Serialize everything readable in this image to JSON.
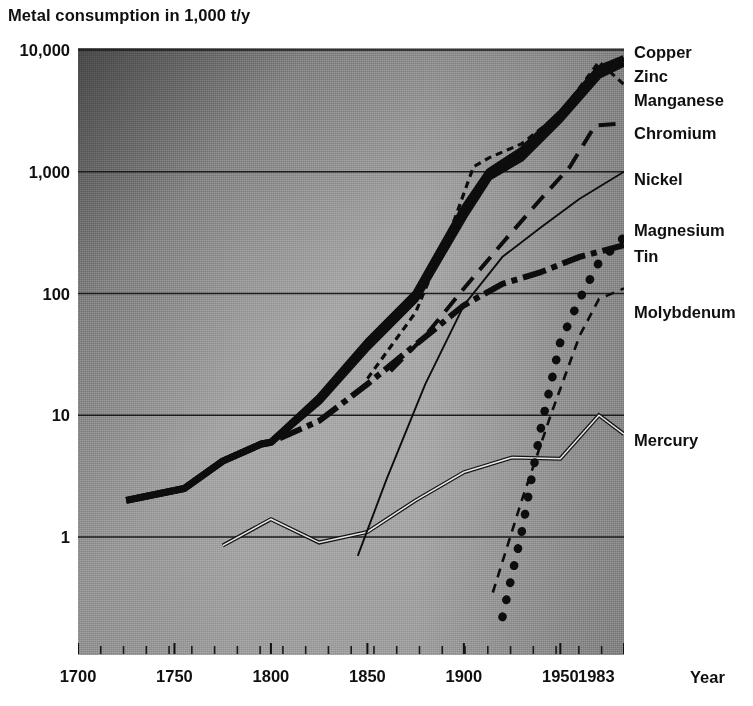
{
  "chart_data": {
    "type": "line",
    "title": "Metal consumption in 1,000 t/y",
    "xlabel": "Year",
    "ylabel": "",
    "yscale": "log",
    "ylim": [
      0.2,
      10000
    ],
    "xlim": [
      1700,
      1983
    ],
    "grid": true,
    "legend_position": "right-inline",
    "y_ticks": [
      "1",
      "10",
      "100",
      "1,000",
      "10,000"
    ],
    "y_tick_values": [
      1,
      10,
      100,
      1000,
      10000
    ],
    "x_ticks": [
      "1700",
      "1750",
      "1800",
      "1850",
      "1900",
      "1950",
      "1983"
    ],
    "x_tick_values": [
      1700,
      1750,
      1800,
      1850,
      1900,
      1950,
      1983
    ],
    "x_unit_label": "Year",
    "series": [
      {
        "name": "Copper",
        "style": "thick-solid",
        "x": [
          1725,
          1755,
          1775,
          1795,
          1800,
          1825,
          1850,
          1875,
          1900,
          1913,
          1930,
          1950,
          1970,
          1983
        ],
        "y": [
          2.0,
          2.5,
          4.2,
          5.8,
          6.0,
          14,
          40,
          100,
          500,
          1000,
          1500,
          3000,
          7000,
          8500
        ]
      },
      {
        "name": "Zinc",
        "style": "thick-solid",
        "x": [
          1725,
          1755,
          1775,
          1795,
          1800,
          1825,
          1850,
          1875,
          1900,
          1913,
          1930,
          1950,
          1970,
          1983
        ],
        "y": [
          2.0,
          2.5,
          4.2,
          5.8,
          6.0,
          13,
          36,
          90,
          430,
          900,
          1300,
          2700,
          6200,
          7800
        ]
      },
      {
        "name": "Manganese",
        "style": "fine-dash",
        "x": [
          1850,
          1875,
          1895,
          1905,
          1913,
          1930,
          1950,
          1970,
          1983
        ],
        "y": [
          20,
          70,
          400,
          1100,
          1300,
          1700,
          3000,
          8000,
          5200
        ]
      },
      {
        "name": "Chromium",
        "style": "long-dash",
        "x": [
          1862,
          1880,
          1900,
          1920,
          1940,
          1955,
          1968,
          1983
        ],
        "y": [
          23,
          45,
          110,
          260,
          600,
          1100,
          2400,
          2500
        ]
      },
      {
        "name": "Nickel",
        "style": "thin-solid",
        "x": [
          1845,
          1860,
          1880,
          1900,
          1920,
          1940,
          1960,
          1983
        ],
        "y": [
          0.7,
          3.0,
          18,
          80,
          200,
          350,
          600,
          1000
        ]
      },
      {
        "name": "Magnesium",
        "style": "heavy-dot",
        "x": [
          1920,
          1930,
          1940,
          1950,
          1960,
          1970,
          1983
        ],
        "y": [
          0.22,
          1.1,
          8,
          40,
          90,
          180,
          290
        ]
      },
      {
        "name": "Tin",
        "style": "dash-dot-thick",
        "x": [
          1725,
          1755,
          1775,
          1795,
          1800,
          1825,
          1850,
          1875,
          1900,
          1920,
          1940,
          1960,
          1983
        ],
        "y": [
          2.0,
          2.5,
          4.2,
          5.8,
          6.0,
          9,
          18,
          38,
          80,
          120,
          150,
          200,
          250
        ]
      },
      {
        "name": "Molybdenum",
        "style": "fine-dash-thin",
        "x": [
          1915,
          1930,
          1945,
          1960,
          1970,
          1983
        ],
        "y": [
          0.35,
          2.0,
          10,
          45,
          90,
          110
        ]
      },
      {
        "name": "Mercury",
        "style": "double-line",
        "x": [
          1775,
          1800,
          1825,
          1850,
          1875,
          1900,
          1925,
          1950,
          1970,
          1983
        ],
        "y": [
          0.85,
          1.4,
          0.9,
          1.1,
          2.0,
          3.4,
          4.5,
          4.4,
          10.0,
          7.0
        ]
      }
    ]
  },
  "legend": [
    {
      "label": "Copper",
      "top": 44
    },
    {
      "label": "Zinc",
      "top": 68
    },
    {
      "label": "Manganese",
      "top": 92
    },
    {
      "label": "Chromium",
      "top": 125
    },
    {
      "label": "Nickel",
      "top": 171
    },
    {
      "label": "Magnesium",
      "top": 222
    },
    {
      "label": "Tin",
      "top": 248
    },
    {
      "label": "Molybdenum",
      "top": 304
    },
    {
      "label": "Mercury",
      "top": 432
    }
  ]
}
